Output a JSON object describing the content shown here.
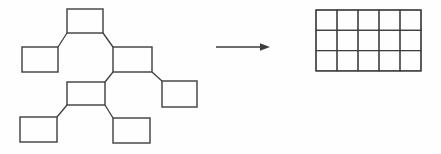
{
  "figure": {
    "background_color": "#fefefe",
    "stroke_color": "#3d3d3d",
    "node_fill": "#fefefe"
  },
  "tree": {
    "nodes": [
      {
        "id": "node-root",
        "x": 67,
        "y": 9,
        "w": 36,
        "h": 24
      },
      {
        "id": "node-left-child",
        "x": 22,
        "y": 47,
        "w": 36,
        "h": 25
      },
      {
        "id": "node-right-child",
        "x": 113,
        "y": 47,
        "w": 39,
        "h": 25
      },
      {
        "id": "node-middle-grandchild",
        "x": 67,
        "y": 82,
        "w": 38,
        "h": 23
      },
      {
        "id": "node-right-grandchild",
        "x": 162,
        "y": 81,
        "w": 35,
        "h": 26
      },
      {
        "id": "node-bottom-left-leaf",
        "x": 20,
        "y": 117,
        "w": 37,
        "h": 25
      },
      {
        "id": "node-bottom-middle-leaf",
        "x": 113,
        "y": 118,
        "w": 37,
        "h": 25
      }
    ],
    "edges": [
      {
        "from": "node-root",
        "from_corner": "bottom-left",
        "to": "node-left-child",
        "to_corner": "top-right"
      },
      {
        "from": "node-root",
        "from_corner": "bottom-right",
        "to": "node-right-child",
        "to_corner": "top-left"
      },
      {
        "from": "node-right-child",
        "from_corner": "bottom-left",
        "to": "node-middle-grandchild",
        "to_corner": "top-right"
      },
      {
        "from": "node-right-child",
        "from_corner": "bottom-right",
        "to": "node-right-grandchild",
        "to_corner": "top-left"
      },
      {
        "from": "node-middle-grandchild",
        "from_corner": "bottom-left",
        "to": "node-bottom-left-leaf",
        "to_corner": "top-right"
      },
      {
        "from": "node-middle-grandchild",
        "from_corner": "bottom-right",
        "to": "node-bottom-middle-leaf",
        "to_corner": "top-left"
      }
    ]
  },
  "arrow": {
    "x1": 216,
    "x2": 270,
    "y": 47,
    "head_length": 10,
    "head_half_height": 3.8
  },
  "grid": {
    "x": 316,
    "y": 10,
    "cols": 5,
    "rows": 3,
    "cell_w": 21,
    "cell_h": 20.3
  }
}
